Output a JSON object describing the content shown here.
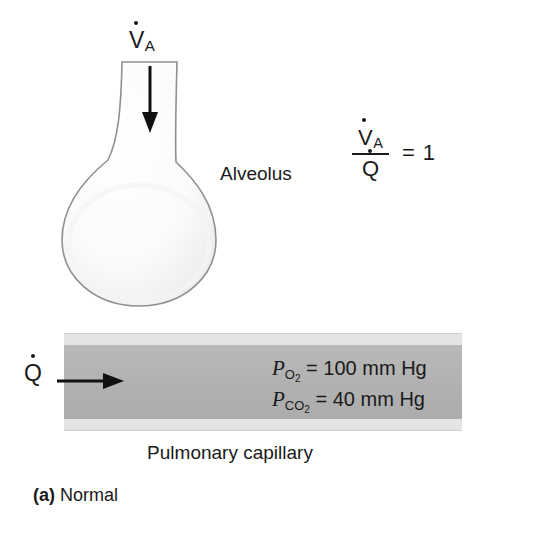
{
  "figure": {
    "caption_letter": "(a)",
    "caption_text": "Normal",
    "background_color": "#ffffff"
  },
  "alveolus": {
    "label": "Alveolus",
    "fill_color": "#fafafa",
    "stroke_color": "#8c8c8c",
    "airflow_label_base": "V",
    "airflow_label_sub": "A",
    "airflow_arrow": "down-arrow"
  },
  "capillary": {
    "label": "Pulmonary capillary",
    "wall_color": "#e2e2e2",
    "lumen_color": "#b3b3b3",
    "blood_flow_label": "Q",
    "blood_flow_arrow": "right-arrow",
    "gases": [
      {
        "symbol": "P",
        "subscript": "O",
        "sub_number": "2",
        "equals": "=",
        "value": "100",
        "units": "mm Hg"
      },
      {
        "symbol": "P",
        "subscript": "CO",
        "sub_number": "2",
        "equals": "=",
        "value": "40",
        "units": "mm Hg"
      }
    ]
  },
  "ratio": {
    "numerator_base": "V",
    "numerator_sub": "A",
    "denominator_base": "Q",
    "equals": "=",
    "value": "1"
  }
}
